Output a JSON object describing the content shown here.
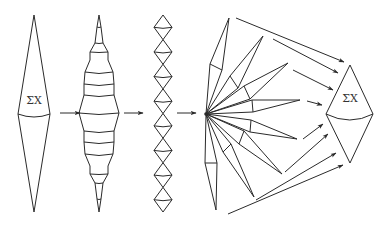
{
  "diagram": {
    "title": "",
    "stroke_color": "#2a2a2a",
    "background": "#ffffff",
    "stages": [
      {
        "id": "single-spindle",
        "label": "ΣX",
        "center_x": 34,
        "top": 15,
        "bottom": 212,
        "half_width": 16,
        "waist_y": 114
      },
      {
        "id": "stacked-spindle",
        "label": "",
        "center_x": 99
      },
      {
        "id": "diamond-chain",
        "label": "",
        "center_x": 163,
        "count": 8
      },
      {
        "id": "fan",
        "label": "",
        "center": [
          206,
          114
        ],
        "spikes": 8
      },
      {
        "id": "merged-spindle",
        "label": "ΣX",
        "center_x": 350,
        "top": 65,
        "bottom": 163,
        "half_width": 24,
        "waist_y": 114
      }
    ],
    "arrows_between_stages": 3,
    "fan_to_target_arrows": 8,
    "labels": {
      "left_sum": "ΣX",
      "right_sum": "ΣX"
    }
  }
}
